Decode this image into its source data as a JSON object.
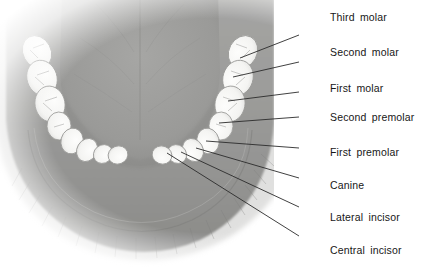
{
  "figure": {
    "width": 422,
    "height": 279,
    "background_color": "#ffffff",
    "view": "occlusal view of lower jaw"
  },
  "colors": {
    "tooth_fill": "#f7f7f5",
    "tooth_outline": "#9a9a98",
    "gum_outer": "#8d8d8b",
    "gum_inner": "#a9a9a7",
    "tongue": "#9b9b99",
    "tongue_shadow": "#8a8a88",
    "leader_line": "#2b2b2b",
    "label_text": "#171717",
    "vestibule": "#bdbdbb"
  },
  "labels": [
    {
      "id": "third-molar",
      "text": "Third molar",
      "x": 330,
      "y": 11,
      "line": {
        "x1": 299,
        "y1": 35,
        "x2": 240,
        "y2": 58
      }
    },
    {
      "id": "second-molar",
      "text": "Second molar",
      "x": 330,
      "y": 46,
      "line": {
        "x1": 299,
        "y1": 62,
        "x2": 233,
        "y2": 77
      }
    },
    {
      "id": "first-molar",
      "text": "First molar",
      "x": 330,
      "y": 82,
      "line": {
        "x1": 299,
        "y1": 92,
        "x2": 228,
        "y2": 101
      }
    },
    {
      "id": "second-premolar",
      "text": "Second premolar",
      "x": 330,
      "y": 111,
      "line": {
        "x1": 299,
        "y1": 117,
        "x2": 219,
        "y2": 123
      }
    },
    {
      "id": "first-premolar",
      "text": "First premolar",
      "x": 330,
      "y": 146,
      "line": {
        "x1": 299,
        "y1": 148,
        "x2": 206,
        "y2": 141
      }
    },
    {
      "id": "canine",
      "text": "Canine",
      "x": 330,
      "y": 179,
      "line": {
        "x1": 299,
        "y1": 178,
        "x2": 196,
        "y2": 148
      }
    },
    {
      "id": "lateral-incisor",
      "text": "Lateral incisor",
      "x": 330,
      "y": 211,
      "line": {
        "x1": 299,
        "y1": 207,
        "x2": 181,
        "y2": 152
      }
    },
    {
      "id": "central-incisor",
      "text": "Central incisor",
      "x": 330,
      "y": 244,
      "line": {
        "x1": 299,
        "y1": 236,
        "x2": 167,
        "y2": 153
      }
    }
  ],
  "teeth": {
    "description": "Sixteen mandibular teeth arranged in a U-shaped arch, eight per side",
    "right_side": [
      {
        "name": "Third molar",
        "cx": 243,
        "cy": 52,
        "rx": 17,
        "ry": 14,
        "rot": -62
      },
      {
        "name": "Second molar",
        "cx": 238,
        "cy": 78,
        "rx": 18,
        "ry": 15,
        "rot": -72
      },
      {
        "name": "First molar",
        "cx": 230,
        "cy": 104,
        "rx": 18,
        "ry": 15,
        "rot": -80
      },
      {
        "name": "Second premolar",
        "cx": 221,
        "cy": 126,
        "rx": 14,
        "ry": 12,
        "rot": -88
      },
      {
        "name": "First premolar",
        "cx": 208,
        "cy": 141,
        "rx": 13,
        "ry": 11,
        "rot": -105
      },
      {
        "name": "Canine",
        "cx": 193,
        "cy": 150,
        "rx": 12,
        "ry": 10,
        "rot": -120
      },
      {
        "name": "Lateral incisor",
        "cx": 177,
        "cy": 154,
        "rx": 10,
        "ry": 9,
        "rot": -140
      },
      {
        "name": "Central incisor",
        "cx": 162,
        "cy": 155,
        "rx": 10,
        "ry": 9,
        "rot": -160
      }
    ],
    "left_side": [
      {
        "name": "Third molar",
        "cx": 37,
        "cy": 52,
        "rx": 17,
        "ry": 14,
        "rot": 62
      },
      {
        "name": "Second molar",
        "cx": 42,
        "cy": 78,
        "rx": 18,
        "ry": 15,
        "rot": 72
      },
      {
        "name": "First molar",
        "cx": 50,
        "cy": 104,
        "rx": 18,
        "ry": 15,
        "rot": 80
      },
      {
        "name": "Second premolar",
        "cx": 59,
        "cy": 126,
        "rx": 14,
        "ry": 12,
        "rot": 88
      },
      {
        "name": "First premolar",
        "cx": 72,
        "cy": 141,
        "rx": 13,
        "ry": 11,
        "rot": 105
      },
      {
        "name": "Canine",
        "cx": 87,
        "cy": 150,
        "rx": 12,
        "ry": 10,
        "rot": 120
      },
      {
        "name": "Lateral incisor",
        "cx": 103,
        "cy": 154,
        "rx": 10,
        "ry": 9,
        "rot": 140
      },
      {
        "name": "Central incisor",
        "cx": 118,
        "cy": 155,
        "rx": 10,
        "ry": 9,
        "rot": 160
      }
    ]
  }
}
